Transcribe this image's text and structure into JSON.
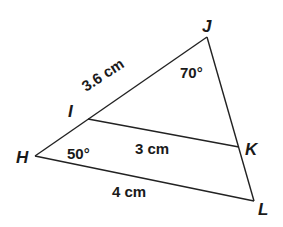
{
  "diagram": {
    "type": "triangle-with-parallel-segment",
    "vertices": {
      "H": {
        "label": "H",
        "x": 35,
        "y": 156
      },
      "I": {
        "label": "I",
        "x": 88,
        "y": 119
      },
      "J": {
        "label": "J",
        "x": 207,
        "y": 37
      },
      "K": {
        "label": "K",
        "x": 239,
        "y": 147
      },
      "L": {
        "label": "L",
        "x": 254,
        "y": 201
      }
    },
    "segments": [
      {
        "from": "H",
        "to": "J",
        "name": "side-HJ"
      },
      {
        "from": "J",
        "to": "L",
        "name": "side-JL"
      },
      {
        "from": "H",
        "to": "L",
        "name": "side-HL"
      },
      {
        "from": "I",
        "to": "K",
        "name": "segment-IK"
      }
    ],
    "measurements": {
      "IJ": "3.6 cm",
      "IK": "3 cm",
      "HL": "4 cm"
    },
    "angles": {
      "J": "70°",
      "H": "50°"
    }
  }
}
